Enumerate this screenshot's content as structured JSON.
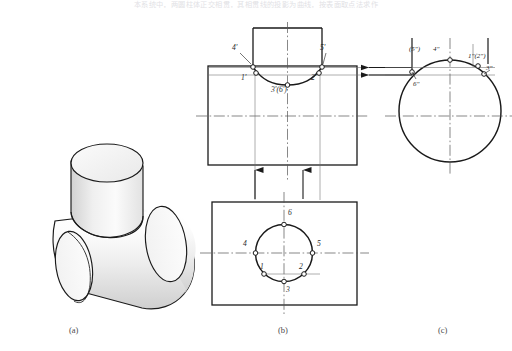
{
  "header": {
    "caption_line": "本系统中，两圆柱体正交相贯，其相贯线的投影为曲线，按表面取点法求作"
  },
  "figure": {
    "captions": [
      {
        "key": "a",
        "text": "(a)",
        "x": 69,
        "y": 325
      },
      {
        "key": "b",
        "text": "(b)",
        "x": 278,
        "y": 325
      },
      {
        "key": "c",
        "text": "(c)",
        "x": 438,
        "y": 325
      }
    ]
  },
  "view_a": {
    "name": "pictorial-view",
    "title": "(a)",
    "description": "isometric of horizontal cylinder with vertical cylinder branch"
  },
  "view_b": {
    "name": "orthographic-views",
    "title": "(b)",
    "front_view_labels": [
      {
        "id": "4p",
        "text": "4'",
        "x": 232,
        "y": 48
      },
      {
        "id": "5p",
        "text": "5'",
        "x": 320,
        "y": 48
      },
      {
        "id": "1p",
        "text": "1'",
        "x": 241,
        "y": 76
      },
      {
        "id": "2p",
        "text": "2'",
        "x": 311,
        "y": 76
      },
      {
        "id": "36p",
        "text": "3'(6')",
        "x": 271,
        "y": 86
      }
    ],
    "top_view_labels": [
      {
        "id": "6",
        "text": "6",
        "x": 288,
        "y": 213
      },
      {
        "id": "4",
        "text": "4",
        "x": 245,
        "y": 243
      },
      {
        "id": "5",
        "text": "5",
        "x": 317,
        "y": 243
      },
      {
        "id": "1",
        "text": "1",
        "x": 263,
        "y": 274
      },
      {
        "id": "2",
        "text": "2",
        "x": 299,
        "y": 274
      },
      {
        "id": "3",
        "text": "3",
        "x": 288,
        "y": 297
      }
    ]
  },
  "view_c": {
    "name": "side-view",
    "title": "(c)",
    "labels": [
      {
        "id": "54dq",
        "text": "(5\")",
        "x": 414,
        "y": 50
      },
      {
        "id": "4dq",
        "text": "4\"",
        "x": 437,
        "y": 50
      },
      {
        "id": "12dq",
        "text": "1\"(2\")",
        "x": 469,
        "y": 57
      },
      {
        "id": "3dq",
        "text": "3\"",
        "x": 482,
        "y": 69
      },
      {
        "id": "6dq",
        "text": "6\"",
        "x": 409,
        "y": 83
      }
    ]
  },
  "colors": {
    "line": "#1a1a1a",
    "thin": "#4a4a4a",
    "center": "#555555",
    "fill_light": "#f4f4f4",
    "fill_shade": "#d8d8d8",
    "caption": "#4a4a4a"
  }
}
